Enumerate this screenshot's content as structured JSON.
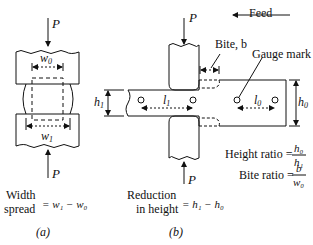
{
  "panel_a": {
    "force_top": "P",
    "force_bottom": "P",
    "w0": "w",
    "w0_sub": "0",
    "w1": "w",
    "w1_sub": "1",
    "caption_line1": "Width",
    "caption_line2": "spread",
    "formula": "= w₁ − w₀",
    "label": "(a)"
  },
  "panel_b": {
    "force_top": "P",
    "force_bottom": "P",
    "feed": "Feed",
    "bite": "Bite, b",
    "gauge_mark": "Gauge mark",
    "h1": "h",
    "h1_sub": "1",
    "h0": "h",
    "h0_sub": "0",
    "l1": "l",
    "l1_sub": "1",
    "l0": "l",
    "l0_sub": "0",
    "height_ratio_label": "Height ratio =",
    "height_ratio_num": "h₀",
    "height_ratio_den": "h₁",
    "bite_ratio_label": "Bite ratio =",
    "bite_ratio_num": "b",
    "bite_ratio_den": "w₀",
    "caption_line1": "Reduction",
    "caption_line2": "in height",
    "formula": "= h₁ − h₀",
    "label": "(b)"
  }
}
